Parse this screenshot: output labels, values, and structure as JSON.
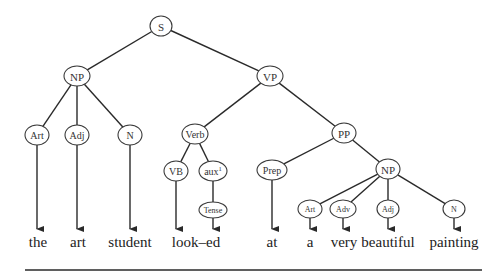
{
  "diagram": {
    "type": "syntax-tree",
    "nodes": [
      {
        "id": "S",
        "label": "S",
        "x": 161,
        "y": 26,
        "rx": 11,
        "ry": 10,
        "size": 11
      },
      {
        "id": "NP1",
        "label": "NP",
        "x": 77,
        "y": 76,
        "rx": 13,
        "ry": 10,
        "size": 11
      },
      {
        "id": "VP",
        "label": "VP",
        "x": 270,
        "y": 76,
        "rx": 13,
        "ry": 10,
        "size": 11
      },
      {
        "id": "Art1",
        "label": "Art",
        "x": 37,
        "y": 135,
        "rx": 12,
        "ry": 10,
        "size": 10
      },
      {
        "id": "Adj1",
        "label": "Adj",
        "x": 77,
        "y": 135,
        "rx": 12,
        "ry": 10,
        "size": 10
      },
      {
        "id": "N1",
        "label": "N",
        "x": 130,
        "y": 135,
        "rx": 12,
        "ry": 10,
        "size": 10
      },
      {
        "id": "Verb",
        "label": "Verb",
        "x": 195,
        "y": 134,
        "rx": 13,
        "ry": 10,
        "size": 10
      },
      {
        "id": "PP",
        "label": "PP",
        "x": 344,
        "y": 133,
        "rx": 12,
        "ry": 10,
        "size": 11
      },
      {
        "id": "VB",
        "label": "VB",
        "x": 176,
        "y": 171,
        "rx": 12,
        "ry": 10,
        "size": 10
      },
      {
        "id": "aux",
        "label": "aux",
        "sup": "1",
        "x": 213,
        "y": 171,
        "rx": 14,
        "ry": 10,
        "size": 10
      },
      {
        "id": "Prep",
        "label": "Prep",
        "x": 272,
        "y": 170,
        "rx": 15,
        "ry": 10,
        "size": 10
      },
      {
        "id": "NP2",
        "label": "NP",
        "x": 388,
        "y": 169,
        "rx": 12,
        "ry": 10,
        "size": 11
      },
      {
        "id": "Tense",
        "label": "Tense",
        "x": 213,
        "y": 210,
        "rx": 14,
        "ry": 8,
        "size": 8
      },
      {
        "id": "Art2",
        "label": "Art",
        "x": 310,
        "y": 209,
        "rx": 12,
        "ry": 9,
        "size": 8
      },
      {
        "id": "Adv",
        "label": "Adv",
        "x": 343,
        "y": 209,
        "rx": 13,
        "ry": 9,
        "size": 8
      },
      {
        "id": "Adj2",
        "label": "Adj",
        "x": 388,
        "y": 209,
        "rx": 11,
        "ry": 9,
        "size": 8
      },
      {
        "id": "N2",
        "label": "N",
        "x": 454,
        "y": 209,
        "rx": 11,
        "ry": 9,
        "size": 8
      }
    ],
    "edges": [
      [
        "S",
        "NP1"
      ],
      [
        "S",
        "VP"
      ],
      [
        "NP1",
        "Art1"
      ],
      [
        "NP1",
        "Adj1"
      ],
      [
        "NP1",
        "N1"
      ],
      [
        "VP",
        "Verb"
      ],
      [
        "VP",
        "PP"
      ],
      [
        "Verb",
        "VB"
      ],
      [
        "Verb",
        "aux"
      ],
      [
        "aux",
        "Tense"
      ],
      [
        "PP",
        "Prep"
      ],
      [
        "PP",
        "NP2"
      ],
      [
        "NP2",
        "Art2"
      ],
      [
        "NP2",
        "Adv"
      ],
      [
        "NP2",
        "Adj2"
      ],
      [
        "NP2",
        "N2"
      ]
    ],
    "leaf_arrows": [
      {
        "from": "Art1",
        "x": 37,
        "to_y": 229
      },
      {
        "from": "Adj1",
        "x": 77,
        "to_y": 229
      },
      {
        "from": "N1",
        "x": 130,
        "to_y": 229
      },
      {
        "from": "VB",
        "x": 176,
        "to_y": 229
      },
      {
        "from": "Tense",
        "x": 213,
        "to_y": 229
      },
      {
        "from": "Prep",
        "x": 272,
        "to_y": 229
      },
      {
        "from": "Art2",
        "x": 310,
        "to_y": 229
      },
      {
        "from": "Adv",
        "x": 343,
        "to_y": 229
      },
      {
        "from": "Adj2",
        "x": 388,
        "to_y": 229
      },
      {
        "from": "N2",
        "x": 454,
        "to_y": 229
      }
    ],
    "words": [
      {
        "text": "the",
        "x": 38
      },
      {
        "text": "art",
        "x": 78
      },
      {
        "text": "student",
        "x": 130
      },
      {
        "text": "look–ed",
        "x": 196
      },
      {
        "text": "at",
        "x": 272
      },
      {
        "text": "a",
        "x": 310
      },
      {
        "text": "very",
        "x": 344
      },
      {
        "text": "beautiful",
        "x": 388
      },
      {
        "text": "painting",
        "x": 454
      }
    ],
    "words_y": 247,
    "rule": {
      "x1": 25,
      "x2": 482,
      "y": 270
    }
  }
}
